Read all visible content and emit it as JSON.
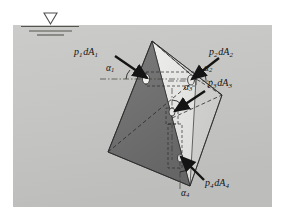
{
  "figure": {
    "background_color": "#ffffff",
    "panel_color": "#c6c6c4",
    "panel": {
      "x": 13,
      "y": 25,
      "width": 259,
      "height": 182
    }
  },
  "water_surface": {
    "name": "free-surface-symbol",
    "triangle_glyph": "inverted-triangle",
    "line_count": 3,
    "color": "#5a5a58"
  },
  "solid": {
    "name": "tetrahedron",
    "faces": [
      {
        "id": "face-left-dark",
        "color": "#6e6e6e",
        "label": "dA1 face"
      },
      {
        "id": "face-front-light",
        "color": "#e2e2e0",
        "label": "dA2 face"
      },
      {
        "id": "face-right-mid",
        "color": "#d2d2d0",
        "label": "dA3 face"
      },
      {
        "id": "face-bottom",
        "color": "#777775",
        "label": "dA4 face"
      }
    ],
    "edge_color": "#2b2b2b",
    "hidden_edge_style": "dashed"
  },
  "forces": [
    {
      "id": "f1",
      "label_p": "p",
      "label_sub": "1",
      "label_dA": "dA",
      "text": "p1 dA1",
      "angle_label": "α",
      "angle_sub": "1",
      "direction": "into face from upper-left"
    },
    {
      "id": "f2",
      "label_p": "p",
      "label_sub": "2",
      "label_dA": "dA",
      "text": "p2 dA2",
      "angle_label": "α",
      "angle_sub": "2",
      "direction": "into face from upper-right"
    },
    {
      "id": "f3",
      "label_p": "p",
      "label_sub": "3",
      "label_dA": "dA",
      "text": "p3 dA3",
      "angle_label": "α",
      "angle_sub": "3",
      "direction": "into face from right"
    },
    {
      "id": "f4",
      "label_p": "p",
      "label_sub": "4",
      "label_dA": "dA",
      "text": "p4 dA4",
      "angle_label": "α",
      "angle_sub": "4",
      "direction": "into face from lower-right"
    }
  ],
  "labels": {
    "p1": {
      "base": "p",
      "sub1": "1",
      "d": "dA",
      "sub2": "1"
    },
    "p2": {
      "base": "p",
      "sub1": "2",
      "d": "dA",
      "sub2": "2"
    },
    "p3": {
      "base": "p",
      "sub1": "3",
      "d": "dA",
      "sub2": "3"
    },
    "p4": {
      "base": "p",
      "sub1": "4",
      "d": "dA",
      "sub2": "4"
    },
    "a1": {
      "base": "α",
      "sub": "1"
    },
    "a2": {
      "base": "α",
      "sub": "2"
    },
    "a3": {
      "base": "α",
      "sub": "3"
    },
    "a4": {
      "base": "α",
      "sub": "4"
    }
  }
}
